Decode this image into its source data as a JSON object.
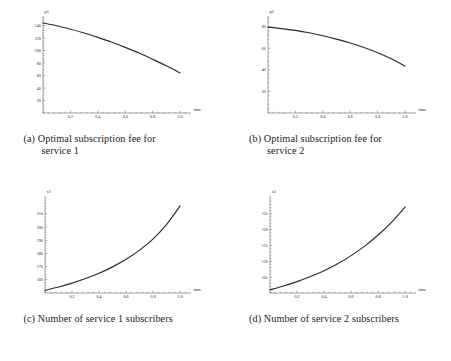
{
  "figure": {
    "layout": "2x2",
    "background": "#ffffff",
    "curve_color": "#2b2b2b",
    "axis_color": "#555555"
  },
  "subfigures": [
    {
      "label": "(a)",
      "caption_line1": "Optimal subscription fee for",
      "caption_line2": "service 1",
      "caption_full": "(a) Optimal subscription fee for service 1"
    },
    {
      "label": "(b)",
      "caption_line1": "Optimal subscription fee for",
      "caption_line2": "service 2",
      "caption_full": "(b) Optimal subscription fee for service 2"
    },
    {
      "label": "(c)",
      "caption_line1": "Number of service 1 subscribers",
      "caption_line2": "",
      "caption_full": "(c) Number of service 1 subscribers"
    },
    {
      "label": "(d)",
      "caption_line1": "Number of service 2 subscribers",
      "caption_line2": "",
      "caption_full": "(d) Number of service 2 subscribers"
    }
  ],
  "chart_data": [
    {
      "type": "line",
      "id": "plot-a",
      "title": "",
      "ylabel": "p1",
      "xlabel": "time",
      "xlim": [
        0,
        1.08
      ],
      "ylim": [
        0,
        152
      ],
      "xticks": [
        0.2,
        0.4,
        0.6,
        0.8,
        1.0
      ],
      "xtick_labels": [
        "0.2",
        "0.4",
        "0.6",
        "0.8",
        "1.0"
      ],
      "yticks": [
        20,
        40,
        60,
        80,
        100,
        120,
        140
      ],
      "ytick_labels": [
        "20",
        "40",
        "60",
        "80",
        "100",
        "120",
        "140"
      ],
      "grid": false,
      "legend": null,
      "x": [
        0.0,
        0.1,
        0.2,
        0.3,
        0.4,
        0.5,
        0.6,
        0.7,
        0.8,
        0.9,
        1.0
      ],
      "y": [
        144.0,
        139.5,
        134.0,
        128.0,
        121.0,
        113.5,
        105.0,
        96.0,
        86.0,
        75.5,
        64.0
      ]
    },
    {
      "type": "line",
      "id": "plot-b",
      "title": "",
      "ylabel": "p2",
      "xlabel": "time",
      "xlim": [
        0,
        1.08
      ],
      "ylim": [
        0,
        88
      ],
      "xticks": [
        0.2,
        0.4,
        0.6,
        0.8,
        1.0
      ],
      "xtick_labels": [
        "0.2",
        "0.4",
        "0.6",
        "0.8",
        "1.0"
      ],
      "yticks": [
        20,
        40,
        60,
        80
      ],
      "ytick_labels": [
        "20",
        "40",
        "60",
        "80"
      ],
      "grid": false,
      "legend": null,
      "x": [
        0.0,
        0.1,
        0.2,
        0.3,
        0.4,
        0.5,
        0.6,
        0.7,
        0.8,
        0.9,
        1.0
      ],
      "y": [
        79.5,
        78.2,
        76.5,
        74.3,
        71.6,
        68.4,
        64.8,
        60.6,
        55.8,
        50.2,
        43.5
      ]
    },
    {
      "type": "line",
      "id": "plot-c",
      "title": "",
      "ylabel": "x1",
      "xlabel": "time",
      "xlim": [
        0,
        1.08
      ],
      "ylim": [
        150,
        222
      ],
      "xticks": [
        0.2,
        0.4,
        0.6,
        0.8,
        1.0
      ],
      "xtick_labels": [
        "0.2",
        "0.4",
        "0.6",
        "0.8",
        "1.0"
      ],
      "yticks": [
        160,
        170,
        180,
        190,
        200,
        210
      ],
      "ytick_labels": [
        "160",
        "170",
        "180",
        "190",
        "200",
        "210"
      ],
      "grid": false,
      "legend": null,
      "x": [
        0.0,
        0.1,
        0.2,
        0.3,
        0.4,
        0.5,
        0.6,
        0.7,
        0.8,
        0.9,
        1.0
      ],
      "y": [
        152.0,
        154.5,
        157.5,
        161.0,
        165.0,
        169.8,
        175.5,
        182.5,
        191.0,
        202.0,
        216.0
      ]
    },
    {
      "type": "line",
      "id": "plot-d",
      "title": "",
      "ylabel": "x2",
      "xlabel": "time",
      "xlim": [
        0,
        1.08
      ],
      "ylim": [
        100,
        130
      ],
      "xticks": [
        0.2,
        0.4,
        0.6,
        0.8,
        1.0
      ],
      "xtick_labels": [
        "0.2",
        "0.4",
        "0.6",
        "0.8",
        "1.0"
      ],
      "yticks": [
        105,
        110,
        115,
        120,
        125
      ],
      "ytick_labels": [
        "105",
        "110",
        "115",
        "120",
        "125"
      ],
      "grid": false,
      "legend": null,
      "x": [
        0.0,
        0.1,
        0.2,
        0.3,
        0.4,
        0.5,
        0.6,
        0.7,
        0.8,
        0.9,
        1.0
      ],
      "y": [
        101.0,
        102.2,
        103.6,
        105.2,
        107.0,
        109.2,
        111.8,
        114.8,
        118.3,
        122.4,
        127.2
      ]
    }
  ]
}
